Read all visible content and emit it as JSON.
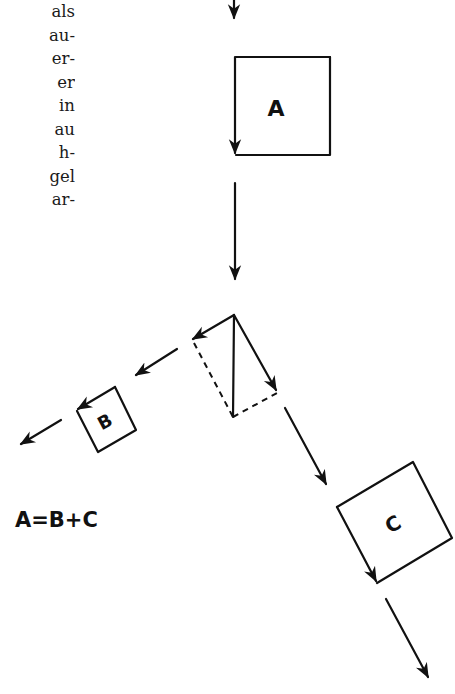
{
  "text_fragments": [
    "als",
    "au-",
    "er-",
    "er",
    "in",
    "au",
    "h-",
    "gel",
    "ar-"
  ],
  "diagram": {
    "box_a_label": "A",
    "box_b_label": "B",
    "box_c_label": "C",
    "equation": "A=B+C"
  },
  "colors": {
    "ink": "#111111",
    "background": "#ffffff"
  }
}
